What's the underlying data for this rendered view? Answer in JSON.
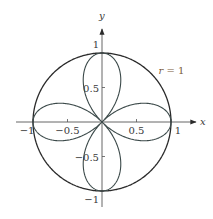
{
  "chart_data": {
    "type": "line",
    "title": "",
    "xlabel": "x",
    "ylabel": "y",
    "xlim": [
      -1.05,
      1.3
    ],
    "ylim": [
      -1.35,
      1.35
    ],
    "x_ticks": [
      {
        "value": -1,
        "label": "−1"
      },
      {
        "value": -0.5,
        "label": "−0.5"
      },
      {
        "value": 0.5,
        "label": "0.5"
      },
      {
        "value": 1,
        "label": "1"
      }
    ],
    "y_ticks": [
      {
        "value": 1,
        "label": "1"
      },
      {
        "value": 0.5,
        "label": "0.5"
      },
      {
        "value": -0.5,
        "label": "−0.5"
      },
      {
        "value": -1,
        "label": "−1"
      }
    ],
    "grid": false,
    "series": [
      {
        "name": "rose",
        "equation": "r = cos(2θ)",
        "theta_range": [
          0,
          6.2832
        ],
        "color": "#3c4a4a"
      },
      {
        "name": "circle",
        "equation": "r = 1",
        "theta_range": [
          0,
          6.2832
        ],
        "color": "#2a2a2a"
      }
    ],
    "annotations": [
      {
        "text_var": "r",
        "text_rest": " = 1",
        "x": 0.82,
        "y": 0.7
      }
    ]
  }
}
